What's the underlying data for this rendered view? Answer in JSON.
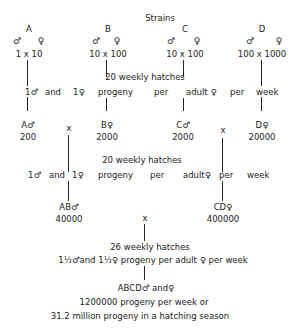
{
  "title": "Strains",
  "strains": [
    {
      "label": "A",
      "male_symbol": "♂",
      "female_symbol": "♀",
      "cross": "1 x 10"
    },
    {
      "label": "B",
      "male_symbol": "♂",
      "female_symbol": "♀",
      "cross": "10 x 100"
    },
    {
      "label": "C",
      "male_symbol": "♂",
      "female_symbol": "♀",
      "cross": "10 x 100"
    },
    {
      "label": "D",
      "male_symbol": "♂",
      "female_symbol": "♀",
      "cross": "100 x 1000"
    }
  ],
  "stage1": {
    "hatches": "20 weekly hatches",
    "progeny_words": [
      "1♂",
      "and",
      "1♀",
      "progeny",
      "per",
      "adult ♀",
      "per",
      "week"
    ],
    "results": [
      {
        "label": "A♂",
        "value": "200"
      },
      {
        "label": "B♀",
        "value": "2000"
      },
      {
        "label": "C♂",
        "value": "2000"
      },
      {
        "label": "D♀",
        "value": "20000"
      }
    ],
    "cross_marks": [
      "x",
      "x"
    ]
  },
  "stage2": {
    "hatches": "20 weekly hatches",
    "progeny_words": [
      "1♂",
      "and",
      "1♀",
      "progeny",
      "per",
      "adult♀",
      "per",
      "week"
    ],
    "results": [
      {
        "label": "AB♂",
        "value": "40000"
      },
      {
        "label": "CD♀",
        "value": "400000"
      }
    ],
    "cross_mark": "x"
  },
  "stage3": {
    "hatches": "26 weekly hatches",
    "progeny": "1½♂and 1½♀ progeny per adult ♀ per week",
    "result_label": "ABCD♂ and♀",
    "result_line1": "1200000 progeny per week or",
    "result_line2": "31.2 million progeny in a hatching season"
  }
}
